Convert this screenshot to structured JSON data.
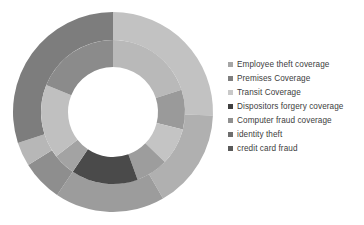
{
  "chart_data": {
    "type": "pie",
    "variant": "doughnut-double-ring",
    "title": "",
    "subtitle": "",
    "xlabel": "",
    "ylabel": "",
    "grid": false,
    "legend_position": "right",
    "center": {
      "x": 113,
      "y": 112
    },
    "radii": {
      "hole": 45,
      "inner_ring_outer": 72,
      "outer_ring_outer": 100
    },
    "categories": [
      "Employee theft coverage",
      "Premises Coverage",
      "Transit Coverage",
      "Dispositors forgery coverage",
      "Computer fraud coverage",
      "identity theft",
      "credit card fraud"
    ],
    "colors": [
      "#a6a6a6",
      "#7f7f7f",
      "#c9c9c9",
      "#404040",
      "#909090",
      "#6e6e6e",
      "#5a5a5a"
    ],
    "series": [
      {
        "name": "Outer ring",
        "ring": "outer",
        "segments": [
          {
            "category": "Employee theft coverage",
            "color": "#c2c2c2",
            "start_angle": 0,
            "end_angle": 92
          },
          {
            "category": "Premises Coverage",
            "color": "#b0b0b0",
            "start_angle": 92,
            "end_angle": 150
          },
          {
            "category": "Transit Coverage",
            "color": "#9c9c9c",
            "start_angle": 150,
            "end_angle": 214
          },
          {
            "category": "Dispositors forgery coverage",
            "color": "#8e8e8e",
            "start_angle": 214,
            "end_angle": 238
          },
          {
            "category": "Computer fraud coverage",
            "color": "#b7b7b7",
            "start_angle": 238,
            "end_angle": 252
          },
          {
            "category": "identity theft",
            "color": "#7d7d7d",
            "start_angle": 252,
            "end_angle": 360
          }
        ]
      },
      {
        "name": "Inner ring",
        "ring": "inner",
        "segments": [
          {
            "category": "Employee theft coverage",
            "color": "#b9b9b9",
            "start_angle": 0,
            "end_angle": 72
          },
          {
            "category": "Premises Coverage",
            "color": "#9a9a9a",
            "start_angle": 72,
            "end_angle": 104
          },
          {
            "category": "Transit Coverage",
            "color": "#c4c4c4",
            "start_angle": 104,
            "end_angle": 134
          },
          {
            "category": "Dispositors forgery coverage",
            "color": "#9d9d9d",
            "start_angle": 134,
            "end_angle": 160
          },
          {
            "category": "Computer fraud coverage",
            "color": "#4a4a4a",
            "start_angle": 160,
            "end_angle": 214
          },
          {
            "category": "identity theft",
            "color": "#a3a3a3",
            "start_angle": 214,
            "end_angle": 232
          },
          {
            "category": "credit card fraud",
            "color": "#c0c0c0",
            "start_angle": 232,
            "end_angle": 292
          },
          {
            "category": "credit card fraud b",
            "color": "#8b8b8b",
            "start_angle": 292,
            "end_angle": 360
          }
        ]
      }
    ],
    "values": [
      26,
      16,
      18,
      12,
      10,
      11,
      7
    ]
  },
  "legend": {
    "items": [
      {
        "label": "Employee theft coverage",
        "color": "#a6a6a6"
      },
      {
        "label": "Premises Coverage",
        "color": "#7f7f7f"
      },
      {
        "label": "Transit Coverage",
        "color": "#c9c9c9"
      },
      {
        "label": "Dispositors forgery coverage",
        "color": "#404040"
      },
      {
        "label": "Computer fraud coverage",
        "color": "#909090"
      },
      {
        "label": "identity theft",
        "color": "#6e6e6e"
      },
      {
        "label": "credit card fraud",
        "color": "#5a5a5a"
      }
    ]
  }
}
